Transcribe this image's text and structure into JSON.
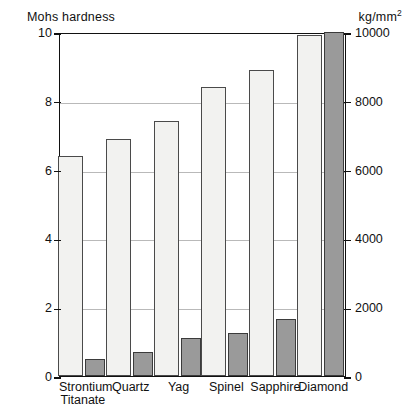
{
  "axes": {
    "left_title": "Mohs hardness",
    "right_title_main": "kg/mm",
    "right_title_sup": "2",
    "left_ticks": [
      "0",
      "2",
      "4",
      "6",
      "8",
      "10"
    ],
    "right_ticks": [
      "0",
      "2000",
      "4000",
      "6000",
      "8000",
      "10000"
    ]
  },
  "categories": [
    {
      "line1": "Strontium",
      "line2": "Titanate"
    },
    {
      "line1": "Quartz",
      "line2": ""
    },
    {
      "line1": "Yag",
      "line2": ""
    },
    {
      "line1": "Spinel",
      "line2": ""
    },
    {
      "line1": "Sapphire",
      "line2": ""
    },
    {
      "line1": "Diamond",
      "line2": ""
    }
  ],
  "colors": {
    "mohs_bar": "#f2f2f0",
    "kg_bar": "#9a9a9a",
    "frame": "#111111",
    "gridline": "#b9b9b9"
  },
  "chart_data": {
    "type": "bar",
    "title": "",
    "xlabel": "",
    "ylabel": "Mohs hardness",
    "y2label": "kg/mm2",
    "categories": [
      "Strontium Titanate",
      "Quartz",
      "Yag",
      "Spinel",
      "Sapphire",
      "Diamond"
    ],
    "series": [
      {
        "name": "Mohs hardness",
        "axis": "left",
        "values": [
          6.4,
          6.9,
          7.4,
          8.4,
          8.9,
          9.9
        ]
      },
      {
        "name": "kg/mm2",
        "axis": "right",
        "values": [
          500,
          700,
          1100,
          1250,
          1650,
          10000
        ]
      }
    ],
    "ylim": [
      0,
      10
    ],
    "y2lim": [
      0,
      10000
    ],
    "yticks": [
      0,
      2,
      4,
      6,
      8,
      10
    ],
    "y2ticks": [
      0,
      2000,
      4000,
      6000,
      8000,
      10000
    ],
    "grid": true,
    "legend": "none"
  }
}
